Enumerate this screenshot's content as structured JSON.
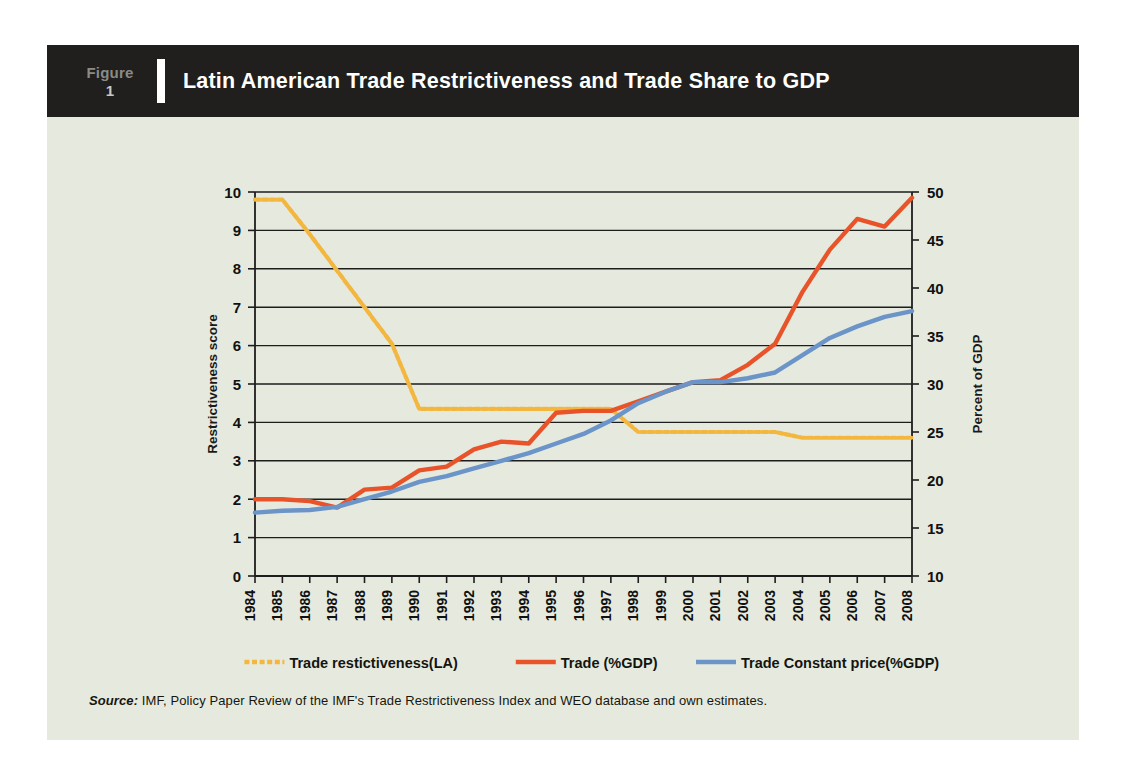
{
  "figure": {
    "tag_word": "Figure",
    "tag_number": "1",
    "title": "Latin American Trade Restrictiveness and Trade Share to GDP",
    "source_label": "Source:",
    "source_text": " IMF, Policy Paper Review of the IMF's Trade Restrictiveness Index and WEO database and own estimates."
  },
  "colors": {
    "panel_background": "#e6eade",
    "header_background": "#201f1d",
    "header_text": "#ffffff",
    "tag_text": "#8b8b86",
    "axis": "#1d1d1d",
    "restrictiveness": "#f3b63f",
    "trade_gdp": "#e8532a",
    "trade_constant": "#6b94c8"
  },
  "chart_data": {
    "type": "line",
    "title": "Latin American Trade Restrictiveness and Trade Share to GDP",
    "xlabel": "",
    "ylabel": "Restrictiveness score",
    "y2label": "Percent of GDP",
    "grid": true,
    "legend_position": "bottom",
    "ylim": [
      0,
      10
    ],
    "y2lim": [
      10,
      50
    ],
    "yticks": [
      0,
      1,
      2,
      3,
      4,
      5,
      6,
      7,
      8,
      9,
      10
    ],
    "y2ticks": [
      10,
      15,
      20,
      25,
      30,
      35,
      40,
      45,
      50
    ],
    "categories": [
      "1984",
      "1985",
      "1986",
      "1987",
      "1988",
      "1989",
      "1990",
      "1991",
      "1992",
      "1993",
      "1994",
      "1995",
      "1996",
      "1997",
      "1998",
      "1999",
      "2000",
      "2001",
      "2002",
      "2003",
      "2004",
      "2005",
      "2006",
      "2007",
      "2008"
    ],
    "series": [
      {
        "name": "Trade restictiveness(LA)",
        "axis": "left",
        "color": "#f3b63f",
        "values": [
          9.8,
          9.8,
          8.9,
          7.95,
          7.0,
          6.05,
          4.35,
          4.35,
          4.35,
          4.35,
          4.35,
          4.35,
          4.35,
          4.35,
          3.75,
          3.75,
          3.75,
          3.75,
          3.75,
          3.75,
          3.6,
          3.6,
          3.6,
          3.6,
          3.6
        ]
      },
      {
        "name": "Trade (%GDP)",
        "axis": "left",
        "color": "#e8532a",
        "values": [
          2.0,
          2.0,
          1.95,
          1.78,
          2.25,
          2.3,
          2.75,
          2.85,
          3.3,
          3.5,
          3.45,
          4.25,
          4.3,
          4.3,
          4.55,
          4.8,
          5.05,
          5.1,
          5.5,
          6.05,
          7.4,
          8.5,
          9.3,
          9.1,
          9.85
        ],
        "values_percent_gdp": [
          17.0,
          17.0,
          16.8,
          16.1,
          18.0,
          18.2,
          19.8,
          20.2,
          21.9,
          22.6,
          22.4,
          25.6,
          25.8,
          25.8,
          26.8,
          27.8,
          29.0,
          29.2,
          30.8,
          32.9,
          38.3,
          42.6,
          45.8,
          45.0,
          48.0
        ]
      },
      {
        "name": "Trade Constant price(%GDP)",
        "axis": "left",
        "color": "#6b94c8",
        "values": [
          1.65,
          1.7,
          1.72,
          1.8,
          2.0,
          2.2,
          2.45,
          2.6,
          2.8,
          3.0,
          3.2,
          3.45,
          3.7,
          4.05,
          4.5,
          4.8,
          5.05,
          5.05,
          5.15,
          5.3,
          5.75,
          6.2,
          6.5,
          6.75,
          6.9
        ],
        "values_percent_gdp": [
          16.0,
          16.2,
          16.3,
          16.2,
          17.0,
          17.8,
          18.8,
          19.4,
          20.2,
          21.0,
          21.8,
          22.8,
          23.8,
          25.2,
          26.6,
          27.8,
          29.0,
          29.0,
          29.4,
          30.0,
          31.8,
          33.6,
          34.8,
          35.8,
          36.4
        ]
      }
    ],
    "legend": [
      {
        "label": "Trade restictiveness(LA)",
        "color": "#f3b63f",
        "dashed": true
      },
      {
        "label": "Trade (%GDP)",
        "color": "#e8532a",
        "dashed": false
      },
      {
        "label": "Trade Constant price(%GDP)",
        "color": "#6b94c8",
        "dashed": false
      }
    ]
  }
}
